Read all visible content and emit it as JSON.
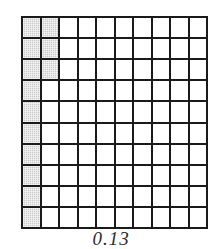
{
  "figure": {
    "caption": "0.13"
  },
  "grid": {
    "rows": 10,
    "columns": 10,
    "total_cells": 100,
    "shaded_count": 13,
    "unshaded_count": 87,
    "line_color": "#1a1a1a",
    "shaded_color": "#c9c9c9",
    "unshaded_color": "#ffffff",
    "shaded_cells": [
      [
        1,
        1
      ],
      [
        1,
        2
      ],
      [
        2,
        1
      ],
      [
        2,
        2
      ],
      [
        3,
        1
      ],
      [
        3,
        2
      ],
      [
        4,
        1
      ],
      [
        5,
        1
      ],
      [
        6,
        1
      ],
      [
        7,
        1
      ],
      [
        8,
        1
      ],
      [
        9,
        1
      ],
      [
        10,
        1
      ]
    ],
    "row_shaded_counts": [
      2,
      2,
      2,
      1,
      1,
      1,
      1,
      1,
      1,
      1
    ],
    "column_shaded_counts": [
      10,
      3,
      0,
      0,
      0,
      0,
      0,
      0,
      0,
      0
    ]
  },
  "chart_data": {
    "type": "heatmap",
    "title": "",
    "categories": [
      "c1",
      "c2",
      "c3",
      "c4",
      "c5",
      "c6",
      "c7",
      "c8",
      "c9",
      "c10"
    ],
    "values": [
      [
        1,
        1,
        0,
        0,
        0,
        0,
        0,
        0,
        0,
        0
      ],
      [
        1,
        1,
        0,
        0,
        0,
        0,
        0,
        0,
        0,
        0
      ],
      [
        1,
        1,
        0,
        0,
        0,
        0,
        0,
        0,
        0,
        0
      ],
      [
        1,
        0,
        0,
        0,
        0,
        0,
        0,
        0,
        0,
        0
      ],
      [
        1,
        0,
        0,
        0,
        0,
        0,
        0,
        0,
        0,
        0
      ],
      [
        1,
        0,
        0,
        0,
        0,
        0,
        0,
        0,
        0,
        0
      ],
      [
        1,
        0,
        0,
        0,
        0,
        0,
        0,
        0,
        0,
        0
      ],
      [
        1,
        0,
        0,
        0,
        0,
        0,
        0,
        0,
        0,
        0
      ],
      [
        1,
        0,
        0,
        0,
        0,
        0,
        0,
        0,
        0,
        0
      ],
      [
        1,
        0,
        0,
        0,
        0,
        0,
        0,
        0,
        0,
        0
      ]
    ],
    "xlabel": "",
    "ylabel": "",
    "grid": true,
    "legend": false,
    "annotations": [
      "0.13"
    ]
  }
}
